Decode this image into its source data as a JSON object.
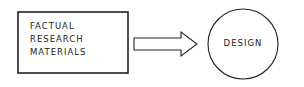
{
  "diagram": {
    "source_box": {
      "lines": [
        "FACTUAL",
        "RESEARCH",
        "MATERIALS"
      ]
    },
    "arrow": {
      "direction": "right"
    },
    "target_circle": {
      "label": "DESIGN"
    },
    "colors": {
      "stroke": "#222222",
      "background": "#ffffff"
    }
  }
}
